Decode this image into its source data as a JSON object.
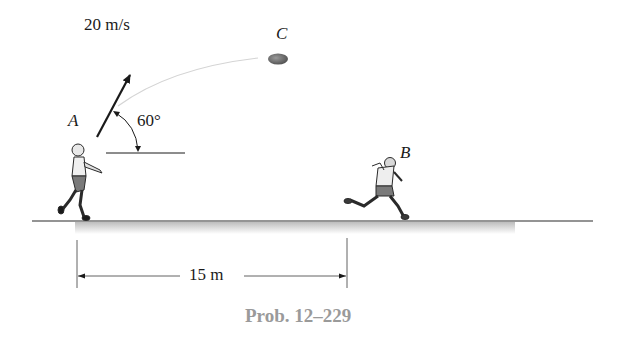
{
  "figure": {
    "caption": "Prob. 12–229",
    "velocity_label": "20 m/s",
    "angle_label": "60°",
    "distance_label": "15 m",
    "points": {
      "A": "A",
      "B": "B",
      "C": "C"
    }
  },
  "colors": {
    "ink": "#1a1a1a",
    "caption": "#9a9a9a",
    "trajectory": "#d0d0d0",
    "ground_shade": "#cfcfcf",
    "ball": "#6f6f6f"
  }
}
